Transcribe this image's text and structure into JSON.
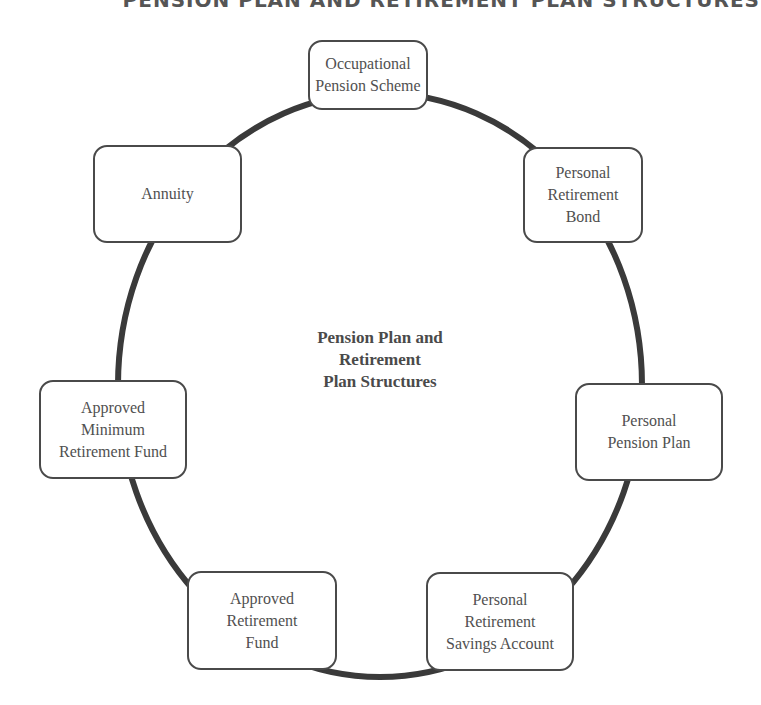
{
  "header": {
    "running_title": "PENSION PLAN AND RETIREMENT PLAN STRUCTURES"
  },
  "diagram": {
    "center": {
      "line1": "Pension Plan and",
      "line2": "Retirement",
      "line3": "Plan Structures"
    },
    "nodes": [
      {
        "id": "occupational",
        "lines": [
          "Occupational",
          "Pension Scheme"
        ]
      },
      {
        "id": "prb",
        "lines": [
          "Personal",
          "Retirement",
          "Bond"
        ]
      },
      {
        "id": "ppp",
        "lines": [
          "Personal",
          "Pension Plan"
        ]
      },
      {
        "id": "prsa",
        "lines": [
          "Personal",
          "Retirement",
          "Savings Account"
        ]
      },
      {
        "id": "arf",
        "lines": [
          "Approved",
          "Retirement",
          "Fund"
        ]
      },
      {
        "id": "amrf",
        "lines": [
          "Approved",
          "Minimum",
          "Retirement Fund"
        ]
      },
      {
        "id": "annuity",
        "lines": [
          "Annuity"
        ]
      }
    ],
    "colors": {
      "ring": "#3a3a3a",
      "border": "#4a4a4a",
      "text": "#505050"
    }
  }
}
